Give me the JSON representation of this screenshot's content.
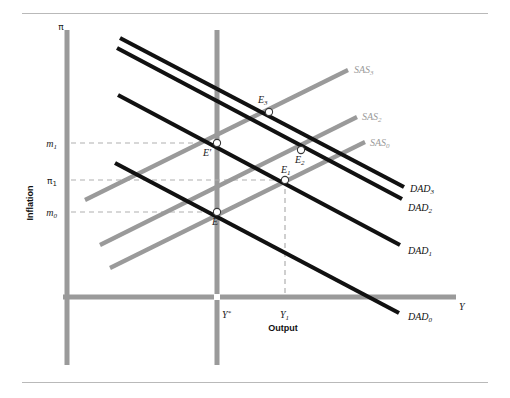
{
  "figure": {
    "axes": {
      "y_axis_symbol": "π",
      "y_axis_title": "Inflation",
      "x_axis_symbol": "Y",
      "x_axis_title": "Output"
    },
    "y_ticks": [
      {
        "id": "m1",
        "base": "m",
        "sub": "1",
        "y": 143
      },
      {
        "id": "pi1",
        "base": "π",
        "sub": "1",
        "y": 180
      },
      {
        "id": "m0",
        "base": "m",
        "sub": "0",
        "y": 212
      }
    ],
    "x_ticks": [
      {
        "id": "ystar",
        "base": "Y",
        "sub": "*",
        "x": 217
      },
      {
        "id": "y1",
        "base": "Y",
        "sub": "1",
        "x": 285
      }
    ],
    "curves": [
      {
        "id": "DAD3",
        "base": "DAD",
        "sub": "3",
        "kind": "dad",
        "color": "#111111",
        "x1": 120,
        "y1": 38,
        "x2": 404,
        "y2": 187,
        "label_x": 410,
        "label_y": 192
      },
      {
        "id": "DAD2",
        "base": "DAD",
        "sub": "2",
        "kind": "dad",
        "color": "#111111",
        "x1": 117,
        "y1": 48,
        "x2": 402,
        "y2": 199,
        "label_x": 408,
        "label_y": 211
      },
      {
        "id": "DAD1",
        "base": "DAD",
        "sub": "1",
        "kind": "dad",
        "color": "#111111",
        "x1": 118,
        "y1": 95,
        "x2": 400,
        "y2": 245,
        "label_x": 408,
        "label_y": 254
      },
      {
        "id": "DAD0",
        "base": "DAD",
        "sub": "0",
        "kind": "dad",
        "color": "#111111",
        "x1": 115,
        "y1": 163,
        "x2": 399,
        "y2": 313,
        "label_x": 408,
        "label_y": 320
      },
      {
        "id": "SAS3",
        "base": "SAS",
        "sub": "3",
        "kind": "sas",
        "color": "#9a9a9a",
        "x1": 85,
        "y1": 200,
        "x2": 348,
        "y2": 70,
        "label_x": 354,
        "label_y": 73
      },
      {
        "id": "SAS2",
        "base": "SAS",
        "sub": "2",
        "kind": "sas",
        "color": "#9a9a9a",
        "x1": 100,
        "y1": 245,
        "x2": 357,
        "y2": 117,
        "label_x": 362,
        "label_y": 120
      },
      {
        "id": "SAS0",
        "base": "SAS",
        "sub": "0",
        "kind": "sas",
        "color": "#9a9a9a",
        "x1": 110,
        "y1": 268,
        "x2": 365,
        "y2": 142,
        "label_x": 370,
        "label_y": 146
      }
    ],
    "points": [
      {
        "id": "E3",
        "base": "E",
        "sub": "3",
        "x": 269,
        "y": 112,
        "label_x": 258,
        "label_y": 103
      },
      {
        "id": "Eprime",
        "base": "E",
        "sub": "′",
        "x": 217,
        "y": 143,
        "label_x": 203,
        "label_y": 156
      },
      {
        "id": "E2",
        "base": "E",
        "sub": "2",
        "x": 301,
        "y": 150,
        "label_x": 295,
        "label_y": 163
      },
      {
        "id": "E1",
        "base": "E",
        "sub": "1",
        "x": 285,
        "y": 180,
        "label_x": 281,
        "label_y": 173
      },
      {
        "id": "E",
        "base": "E",
        "sub": "",
        "x": 217,
        "y": 212,
        "label_x": 212,
        "label_y": 225
      }
    ],
    "guides": [
      {
        "id": "guide-m1",
        "x1": 71,
        "y1": 143,
        "x2": 217,
        "y2": 143
      },
      {
        "id": "guide-pi1",
        "x1": 71,
        "y1": 180,
        "x2": 285,
        "y2": 180
      },
      {
        "id": "guide-m0",
        "x1": 71,
        "y1": 212,
        "x2": 217,
        "y2": 212
      },
      {
        "id": "guide-y1",
        "x1": 285,
        "y1": 180,
        "x2": 285,
        "y2": 297
      }
    ],
    "colors": {
      "axis": "#9a9a9a",
      "dad": "#111111",
      "sas": "#9a9a9a",
      "guide": "#b0b0b0",
      "rule": "#b9b9b9",
      "background": "#ffffff"
    }
  }
}
